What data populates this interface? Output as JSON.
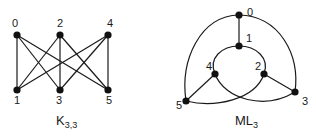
{
  "graphs": [
    {
      "name": "K3,3",
      "caption": {
        "main": "K",
        "sub": "3,3"
      },
      "nodes": [
        {
          "id": "0",
          "x": 17,
          "y": 35,
          "lx": 12,
          "ly": 27
        },
        {
          "id": "2",
          "x": 60,
          "y": 35,
          "lx": 57,
          "ly": 27
        },
        {
          "id": "4",
          "x": 108,
          "y": 35,
          "lx": 107,
          "ly": 27
        },
        {
          "id": "1",
          "x": 17,
          "y": 90,
          "lx": 14,
          "ly": 104
        },
        {
          "id": "3",
          "x": 60,
          "y": 90,
          "lx": 56,
          "ly": 104
        },
        {
          "id": "5",
          "x": 108,
          "y": 90,
          "lx": 106,
          "ly": 104
        }
      ],
      "edges": [
        [
          "0",
          "1"
        ],
        [
          "0",
          "3"
        ],
        [
          "0",
          "5"
        ],
        [
          "2",
          "1"
        ],
        [
          "2",
          "3"
        ],
        [
          "2",
          "5"
        ],
        [
          "4",
          "1"
        ],
        [
          "4",
          "3"
        ],
        [
          "4",
          "5"
        ]
      ]
    },
    {
      "name": "ML3",
      "caption": {
        "main": "ML",
        "sub": "3"
      },
      "nodes": [
        {
          "id": "0",
          "x": 239,
          "y": 15,
          "lx": 247,
          "ly": 16
        },
        {
          "id": "1",
          "x": 239,
          "y": 46,
          "lx": 246,
          "ly": 42
        },
        {
          "id": "4",
          "x": 215,
          "y": 74,
          "lx": 206,
          "ly": 70
        },
        {
          "id": "2",
          "x": 264,
          "y": 74,
          "lx": 255,
          "ly": 70
        },
        {
          "id": "5",
          "x": 186,
          "y": 101,
          "lx": 176,
          "ly": 109
        },
        {
          "id": "3",
          "x": 295,
          "y": 92,
          "lx": 302,
          "ly": 105
        }
      ]
    }
  ]
}
